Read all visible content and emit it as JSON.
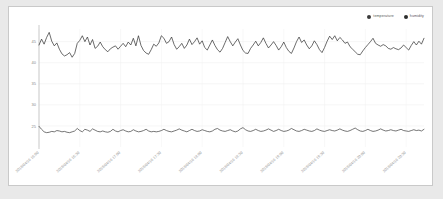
{
  "card": {
    "background": "#ffffff",
    "border_color": "#c9c9c9",
    "page_background": "#e9e9e9"
  },
  "legend": {
    "position": "top-right",
    "items": [
      {
        "label": "temperature",
        "color": "#3b3b3b",
        "icon": "legend-dot-icon"
      },
      {
        "label": "humidity",
        "color": "#2d2d2d",
        "icon": "legend-dot-icon"
      }
    ]
  },
  "chart_data": {
    "type": "line",
    "title": "",
    "xlabel": "",
    "ylabel": "",
    "ylim": [
      20,
      48
    ],
    "yticks": [
      45,
      40,
      35,
      30,
      25
    ],
    "grid": true,
    "legend_position": "top-right",
    "x_tick_labels": [
      "2018/04/16 16:00",
      "2018/04/16 16:30",
      "2018/04/16 17:00",
      "2018/04/16 17:30",
      "2018/04/16 18:00",
      "2018/04/16 18:30",
      "2018/04/16 19:00",
      "2018/04/16 19:30",
      "2018/04/16 20:00",
      "2018/04/16 20:30"
    ],
    "x_tick_indices": [
      0,
      16,
      32,
      48,
      64,
      80,
      96,
      112,
      128,
      144
    ],
    "n_points": 152,
    "series": [
      {
        "name": "humidity",
        "color": "#2d2d2d",
        "values": [
          44.2,
          45.6,
          44.4,
          46.0,
          47.2,
          45.1,
          44.0,
          44.7,
          43.2,
          42.1,
          41.6,
          41.9,
          42.4,
          41.3,
          42.2,
          44.6,
          45.3,
          46.4,
          45.0,
          46.1,
          44.2,
          45.5,
          43.4,
          43.9,
          44.9,
          43.8,
          43.1,
          42.6,
          43.3,
          43.7,
          44.0,
          43.2,
          43.9,
          44.6,
          43.8,
          44.9,
          44.2,
          45.8,
          44.0,
          46.4,
          44.1,
          42.9,
          42.3,
          42.0,
          43.1,
          44.4,
          43.9,
          44.7,
          46.4,
          45.8,
          44.6,
          45.0,
          46.1,
          44.3,
          43.2,
          43.8,
          44.6,
          43.4,
          44.2,
          45.6,
          44.3,
          45.0,
          45.9,
          44.4,
          45.2,
          43.6,
          43.0,
          44.2,
          45.4,
          44.1,
          43.1,
          42.5,
          43.4,
          44.8,
          46.2,
          45.0,
          44.0,
          44.9,
          45.7,
          44.2,
          42.9,
          42.3,
          42.2,
          43.4,
          44.2,
          45.1,
          44.0,
          44.8,
          45.9,
          44.6,
          43.5,
          44.2,
          45.0,
          44.1,
          43.0,
          43.8,
          44.9,
          43.6,
          42.7,
          42.2,
          43.5,
          45.0,
          46.1,
          44.8,
          45.4,
          44.2,
          43.3,
          44.0,
          45.2,
          44.3,
          43.1,
          42.4,
          43.6,
          45.1,
          46.3,
          45.5,
          46.4,
          45.2,
          46.0,
          45.4,
          44.6,
          44.9,
          43.8,
          43.2,
          42.6,
          42.0,
          41.9,
          42.8,
          43.6,
          44.3,
          45.0,
          45.8,
          44.6,
          44.2,
          43.9,
          44.3,
          44.0,
          43.4,
          43.2,
          43.6,
          43.3,
          43.1,
          43.5,
          44.2,
          43.6,
          43.0,
          44.1,
          45.0,
          44.2,
          45.1,
          44.4,
          45.8
        ]
      },
      {
        "name": "temperature",
        "color": "#3b3b3b",
        "values": [
          24.9,
          24.2,
          23.6,
          23.4,
          23.5,
          23.7,
          23.6,
          23.9,
          23.8,
          23.6,
          23.7,
          23.5,
          23.4,
          23.6,
          23.8,
          24.4,
          23.9,
          23.6,
          24.2,
          24.0,
          23.7,
          24.3,
          24.0,
          23.7,
          23.6,
          23.8,
          23.6,
          23.5,
          23.7,
          24.2,
          23.8,
          23.6,
          23.9,
          24.1,
          23.8,
          23.6,
          23.7,
          24.1,
          23.8,
          23.6,
          23.7,
          23.9,
          24.2,
          23.8,
          23.6,
          23.7,
          23.6,
          23.7,
          23.9,
          24.2,
          23.9,
          23.7,
          23.6,
          23.8,
          24.0,
          24.3,
          24.0,
          23.8,
          23.6,
          23.9,
          24.2,
          23.9,
          23.7,
          23.8,
          24.1,
          23.9,
          23.7,
          23.6,
          23.8,
          24.2,
          24.4,
          24.0,
          23.8,
          23.7,
          23.9,
          24.1,
          23.8,
          23.6,
          23.8,
          24.3,
          24.6,
          24.1,
          23.8,
          23.7,
          23.9,
          24.2,
          23.9,
          23.7,
          23.8,
          24.0,
          24.3,
          24.0,
          23.7,
          23.9,
          24.2,
          23.9,
          23.7,
          23.8,
          24.0,
          24.4,
          24.1,
          23.8,
          23.7,
          23.9,
          24.2,
          24.0,
          23.8,
          23.7,
          23.9,
          24.3,
          24.0,
          23.8,
          23.7,
          23.9,
          24.1,
          23.9,
          23.8,
          24.0,
          24.3,
          24.0,
          23.8,
          23.7,
          23.9,
          24.2,
          24.5,
          24.1,
          23.8,
          23.7,
          23.9,
          24.2,
          23.9,
          23.7,
          23.8,
          24.0,
          24.3,
          24.0,
          23.8,
          23.9,
          24.1,
          23.9,
          23.8,
          24.0,
          24.2,
          23.9,
          23.8,
          23.7,
          23.9,
          24.1,
          23.9,
          24.0,
          23.8,
          24.2
        ]
      }
    ]
  }
}
